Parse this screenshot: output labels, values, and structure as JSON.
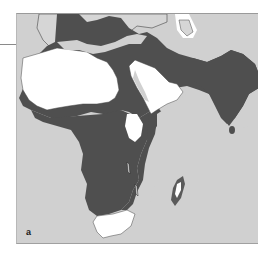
{
  "figure": {
    "panel_label": "a",
    "region": "Africa, Middle East and South Asia",
    "legend_colors": {
      "ocean_background": "#d0d0d0",
      "highlighted_range": "#4f4f4f",
      "desert_white": "#ffffff"
    }
  }
}
